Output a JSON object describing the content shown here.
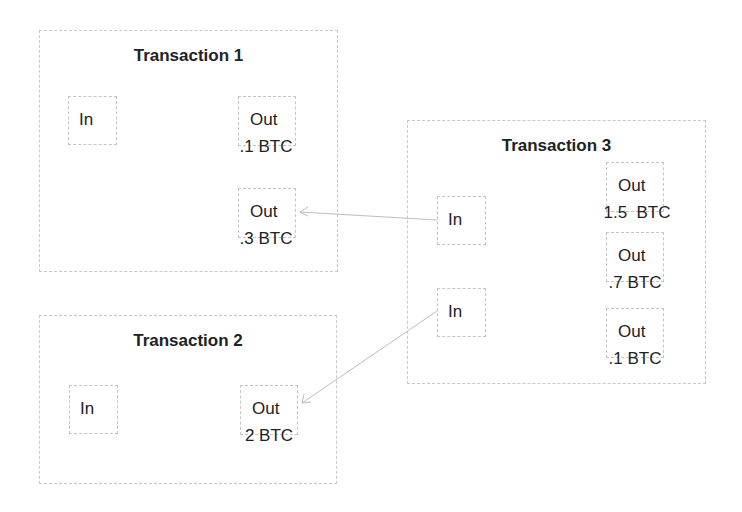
{
  "diagram": {
    "transactions": [
      {
        "title": "Transaction 1",
        "inputs": [
          {
            "label": "In"
          }
        ],
        "outputs": [
          {
            "label": "Out",
            "amount": ".1 BTC"
          },
          {
            "label": "Out",
            "amount": ".3 BTC"
          }
        ]
      },
      {
        "title": "Transaction 2",
        "inputs": [
          {
            "label": "In"
          }
        ],
        "outputs": [
          {
            "label": "Out",
            "amount": "2 BTC"
          }
        ]
      },
      {
        "title": "Transaction 3",
        "inputs": [
          {
            "label": "In"
          },
          {
            "label": "In"
          }
        ],
        "outputs": [
          {
            "label": "Out",
            "amount": "1.5  BTC"
          },
          {
            "label": "Out",
            "amount": ".7 BTC"
          },
          {
            "label": "Out",
            "amount": ".1 BTC"
          }
        ]
      }
    ],
    "edges": [
      {
        "from": "Transaction 3 / In 1",
        "to": "Transaction 1 / Out .3 BTC"
      },
      {
        "from": "Transaction 3 / In 2",
        "to": "Transaction 2 / Out 2 BTC"
      }
    ],
    "colors": {
      "border": "#c8c8c8",
      "arrow": "#bdbdbd",
      "text": "#222222"
    }
  }
}
